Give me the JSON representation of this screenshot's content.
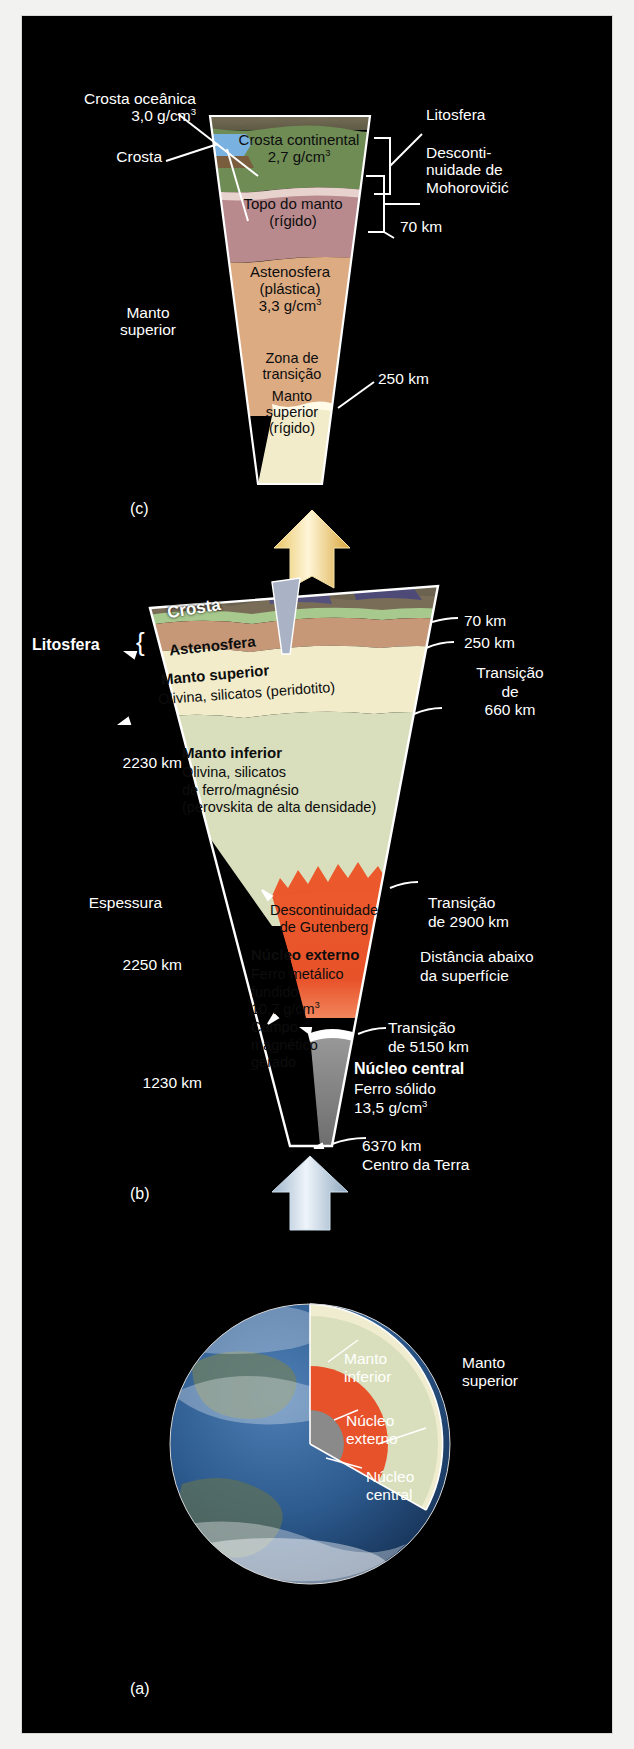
{
  "figure": {
    "background_color": "#000000",
    "page_background": "#f2f2f0"
  },
  "panels": {
    "a": {
      "tag": "(a)",
      "name": "globo-terrestre-em-corte"
    },
    "b": {
      "tag": "(b)",
      "name": "cunha-estrutura-completa"
    },
    "c": {
      "tag": "(c)",
      "name": "cunha-ampliada-manto-superior"
    }
  },
  "panel_c": {
    "tag": "(c)",
    "left_labels": [
      {
        "line1": "Crosta oceânica",
        "line2_value": "3,0",
        "line2_unit": "g/cm",
        "line2_exp": "3"
      },
      {
        "line1": "Crosta"
      },
      {
        "line1": "Manto",
        "line2": "superior"
      }
    ],
    "crosta_oceanica_l1": "Crosta oceânica",
    "crosta_oceanica_val": "3,0 g/cm",
    "crosta_oceanica_exp": "3",
    "crosta": "Crosta",
    "manto_superior_l1": "Manto",
    "manto_superior_l2": "superior",
    "right_labels": {
      "litosfera": "Litosfera",
      "desc_l1": "Desconti-",
      "desc_l2": "nuidade de",
      "desc_l3": "Mohorovičić",
      "km70": "70 km",
      "km250": "250 km"
    },
    "layers": [
      {
        "name": "crosta-continental",
        "l1": "Crosta continental",
        "l2_val": "2,7 g/cm",
        "l2_exp": "3",
        "color": "#6f8c55"
      },
      {
        "name": "topo-do-manto",
        "l1": "Topo do manto",
        "l2": "(rígido)",
        "color": "#b98a8d"
      },
      {
        "name": "astenosfera",
        "l1": "Astenosfera",
        "l2": "(plástica)",
        "l3_val": "3,3 g/cm",
        "l3_exp": "3",
        "color": "#dcab82"
      },
      {
        "name": "zona-de-transicao",
        "l1": "Zona de",
        "l2": "transição",
        "color": "#dcab82"
      },
      {
        "name": "manto-superior-rigido",
        "l1": "Manto",
        "l2": "superior",
        "l3": "(rígido)",
        "color": "#f2eccb"
      }
    ]
  },
  "panel_b": {
    "tag": "(b)",
    "left_labels": {
      "litosfera": "Litosfera",
      "espessura": "Espessura",
      "km2230": "2230 km",
      "km2250": "2250 km",
      "km1230": "1230 km"
    },
    "right_labels": {
      "km70": "70 km",
      "km250": "250 km",
      "trans660_l1": "Transição",
      "trans660_l2": "de",
      "trans660_l3": "660 km",
      "trans2900_l1": "Transição",
      "trans2900_l2": "de 2900 km",
      "distancia_l1": "Distância abaixo",
      "distancia_l2": "da superfície",
      "trans5150_l1": "Transição",
      "trans5150_l2": "de 5150 km",
      "km6370": "6370 km",
      "centro": "Centro da Terra"
    },
    "layers": {
      "crosta": "Crosta",
      "astenosfera": "Astenosfera",
      "manto_superior_b": "Manto superior",
      "manto_superior_sub": "Olivina, silicatos (peridotito)",
      "manto_inferior_b": "Manto inferior",
      "manto_inferior_l1": "Olivina, silicatos",
      "manto_inferior_l2": "de ferro/magnésio",
      "manto_inferior_l3": "(perovskita de alta densidade)",
      "gutenberg_l1": "Descontinuidade",
      "gutenberg_l2": "de Gutenberg",
      "nucleo_externo_b": "Núcleo externo",
      "nucleo_externo_l1": "Ferro metálico",
      "nucleo_externo_l2": "fundido",
      "nucleo_externo_l3_val": "10,7 g/cm",
      "nucleo_externo_l3_exp": "3",
      "nucleo_externo_l4": "Campo",
      "nucleo_externo_l5": "magnético",
      "nucleo_externo_l6": "gerado",
      "nucleo_central_b": "Núcleo central",
      "nucleo_central_l1": "Ferro sólido",
      "nucleo_central_l2_val": "13,5 g/cm",
      "nucleo_central_l2_exp": "3"
    },
    "colors": {
      "manto_superior": "#f2eccb",
      "manto_inferior": "#d9dfbc",
      "nucleo_externo": "#e8522a",
      "nucleo_central": "#8a8a8a"
    }
  },
  "panel_a": {
    "tag": "(a)",
    "labels": {
      "manto_inferior_l1": "Manto",
      "manto_inferior_l2": "inferior",
      "manto_superior_l1": "Manto",
      "manto_superior_l2": "superior",
      "nucleo_externo_l1": "Núcleo",
      "nucleo_externo_l2": "externo",
      "nucleo_central_l1": "Núcleo",
      "nucleo_central_l2": "central"
    }
  }
}
